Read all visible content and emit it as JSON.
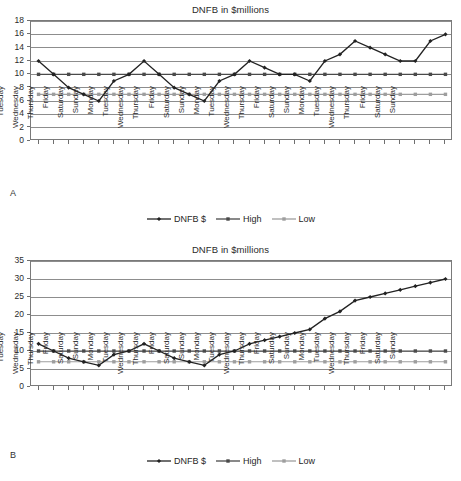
{
  "figure": {
    "panels": [
      {
        "letter": "A",
        "title": "DNFB in $millions",
        "legend": [
          {
            "label": "DNFB $",
            "color": "#222222",
            "marker": "diamond"
          },
          {
            "label": "High",
            "color": "#4a4a4a",
            "marker": "square"
          },
          {
            "label": "Low",
            "color": "#9e9e9e",
            "marker": "square"
          }
        ]
      },
      {
        "letter": "B",
        "title": "DNFB in $millions",
        "legend": [
          {
            "label": "DNFB $",
            "color": "#222222",
            "marker": "diamond"
          },
          {
            "label": "High",
            "color": "#4a4a4a",
            "marker": "square"
          },
          {
            "label": "Low",
            "color": "#9e9e9e",
            "marker": "square"
          }
        ]
      }
    ]
  },
  "chart_data": [
    {
      "type": "line",
      "panel": "A",
      "title": "DNFB in $millions",
      "xlabel": "",
      "ylabel": "",
      "ylim": [
        0,
        18
      ],
      "yticks": [
        0,
        2,
        4,
        6,
        8,
        10,
        12,
        14,
        16,
        18
      ],
      "grid": true,
      "legend_position": "bottom",
      "categories": [
        "Monday",
        "Tuesday",
        "Wednesday",
        "Thursday",
        "Friday",
        "Saturday",
        "Sunday",
        "Monday",
        "Tuesday",
        "Wednesday",
        "Thursday",
        "Friday",
        "Saturday",
        "Sunday",
        "Monday",
        "Tuesday",
        "Wednesday",
        "Thursday",
        "Friday",
        "Saturday",
        "Sunday",
        "Monday",
        "Tuesday",
        "Wednesday",
        "Thursday",
        "Friday",
        "Saturday",
        "Sunday"
      ],
      "series": [
        {
          "name": "DNFB $",
          "color": "#222222",
          "values": [
            12,
            10,
            8,
            7,
            6,
            9,
            10,
            12,
            10,
            8,
            7,
            6,
            9,
            10,
            12,
            11,
            10,
            10,
            9,
            12,
            13,
            15,
            14,
            13,
            12,
            12,
            15,
            16
          ]
        },
        {
          "name": "High",
          "color": "#4a4a4a",
          "values": [
            10,
            10,
            10,
            10,
            10,
            10,
            10,
            10,
            10,
            10,
            10,
            10,
            10,
            10,
            10,
            10,
            10,
            10,
            10,
            10,
            10,
            10,
            10,
            10,
            10,
            10,
            10,
            10
          ]
        },
        {
          "name": "Low",
          "color": "#9e9e9e",
          "values": [
            7,
            7,
            7,
            7,
            7,
            7,
            7,
            7,
            7,
            7,
            7,
            7,
            7,
            7,
            7,
            7,
            7,
            7,
            7,
            7,
            7,
            7,
            7,
            7,
            7,
            7,
            7,
            7
          ]
        }
      ]
    },
    {
      "type": "line",
      "panel": "B",
      "title": "DNFB in $millions",
      "xlabel": "",
      "ylabel": "",
      "ylim": [
        0,
        35
      ],
      "yticks": [
        0,
        5,
        10,
        15,
        20,
        25,
        30,
        35
      ],
      "grid": true,
      "legend_position": "bottom",
      "categories": [
        "Monday",
        "Tuesday",
        "Wednesday",
        "Thursday",
        "Friday",
        "Saturday",
        "Sunday",
        "Monday",
        "Tuesday",
        "Wednesday",
        "Thursday",
        "Friday",
        "Saturday",
        "Sunday",
        "Monday",
        "Tuesday",
        "Wednesday",
        "Thursday",
        "Friday",
        "Saturday",
        "Sunday",
        "Monday",
        "Tuesday",
        "Wednesday",
        "Thursday",
        "Friday",
        "Saturday",
        "Sunday"
      ],
      "series": [
        {
          "name": "DNFB $",
          "color": "#222222",
          "values": [
            12,
            10,
            8,
            7,
            6,
            9,
            10,
            12,
            10,
            8,
            7,
            6,
            9,
            10,
            12,
            13,
            14,
            15,
            16,
            19,
            21,
            24,
            25,
            26,
            27,
            28,
            29,
            30
          ]
        },
        {
          "name": "High",
          "color": "#4a4a4a",
          "values": [
            10,
            10,
            10,
            10,
            10,
            10,
            10,
            10,
            10,
            10,
            10,
            10,
            10,
            10,
            10,
            10,
            10,
            10,
            10,
            10,
            10,
            10,
            10,
            10,
            10,
            10,
            10,
            10
          ]
        },
        {
          "name": "Low",
          "color": "#9e9e9e",
          "values": [
            7,
            7,
            7,
            7,
            7,
            7,
            7,
            7,
            7,
            7,
            7,
            7,
            7,
            7,
            7,
            7,
            7,
            7,
            7,
            7,
            7,
            7,
            7,
            7,
            7,
            7,
            7,
            7
          ]
        }
      ]
    }
  ]
}
